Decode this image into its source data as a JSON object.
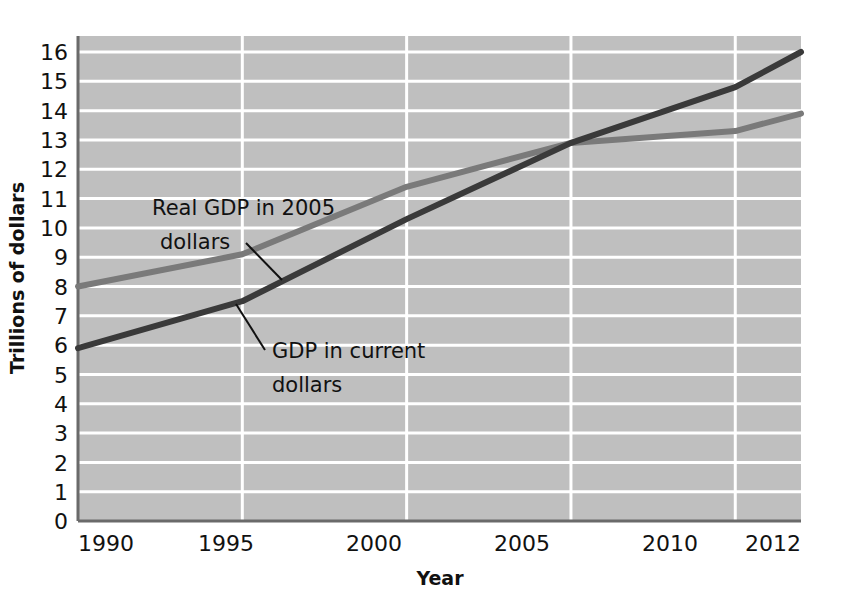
{
  "chart_data": {
    "type": "line",
    "title": "",
    "xlabel": "Year",
    "ylabel": "Trillions of dollars",
    "xlim": [
      1990,
      2012
    ],
    "ylim": [
      0,
      16
    ],
    "grid": true,
    "legend_position": "inline-annotations",
    "x_tick_labels": [
      "1990",
      "1995",
      "2000",
      "2005",
      "2010",
      "2012"
    ],
    "x_ticks": [
      1990,
      1995,
      2000,
      2005,
      2010,
      2012
    ],
    "y_tick_labels": [
      "0",
      "1",
      "2",
      "3",
      "4",
      "5",
      "6",
      "7",
      "8",
      "9",
      "10",
      "11",
      "12",
      "13",
      "14",
      "15",
      "16"
    ],
    "y_ticks": [
      0,
      1,
      2,
      3,
      4,
      5,
      6,
      7,
      8,
      9,
      10,
      11,
      12,
      13,
      14,
      15,
      16
    ],
    "plot_background": "#bfbfbf",
    "gridline_color": "#ffffff",
    "axis_color": "#555555",
    "series": [
      {
        "name": "Real GDP in 2005 dollars",
        "color": "#7a7a7a",
        "x": [
          1990,
          1995,
          2000,
          2005,
          2010,
          2012
        ],
        "values": [
          8.0,
          9.1,
          11.4,
          12.9,
          13.3,
          13.9
        ]
      },
      {
        "name": "GDP in current dollars",
        "color": "#3a3a3a",
        "x": [
          1990,
          1995,
          2000,
          2005,
          2010,
          2012
        ],
        "values": [
          5.9,
          7.5,
          10.3,
          12.9,
          14.8,
          16.0
        ]
      }
    ],
    "annotations": [
      {
        "id": "real-gdp",
        "lines": [
          "Real GDP in 2005",
          "dollars"
        ],
        "text": "Real GDP in 2005 dollars"
      },
      {
        "id": "current-gdp",
        "lines": [
          "GDP in current",
          "dollars"
        ],
        "text": "GDP in current dollars"
      }
    ]
  },
  "axis": {
    "y_title": "Trillions of dollars",
    "x_title": "Year"
  },
  "y_tick_0": "0",
  "y_tick_1": "1",
  "y_tick_2": "2",
  "y_tick_3": "3",
  "y_tick_4": "4",
  "y_tick_5": "5",
  "y_tick_6": "6",
  "y_tick_7": "7",
  "y_tick_8": "8",
  "y_tick_9": "9",
  "y_tick_10": "10",
  "y_tick_11": "11",
  "y_tick_12": "12",
  "y_tick_13": "13",
  "y_tick_14": "14",
  "y_tick_15": "15",
  "y_tick_16": "16",
  "x_tick_1990": "1990",
  "x_tick_1995": "1995",
  "x_tick_2000": "2000",
  "x_tick_2005": "2005",
  "x_tick_2010": "2010",
  "x_tick_2012": "2012",
  "annot_real_line1": "Real GDP in 2005",
  "annot_real_line2": "dollars",
  "annot_current_line1": "GDP in current",
  "annot_current_line2": "dollars"
}
